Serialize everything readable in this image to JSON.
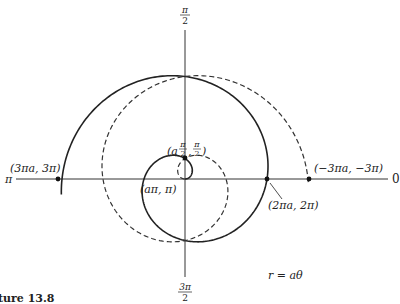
{
  "figure": {
    "caption": "ture 13.8",
    "equation": "r = aθ",
    "colors": {
      "ink": "#222222",
      "background": "#ffffff"
    },
    "axis_labels": {
      "top": {
        "num": "π",
        "den": "2"
      },
      "bottom": {
        "num": "3π",
        "den": "2"
      },
      "left": "π",
      "right": "0"
    },
    "points": [
      {
        "id": "p-3pi",
        "label": "(3πa, 3π)",
        "x": 62,
        "y": 179
      },
      {
        "id": "p-pi",
        "label": "(aπ, π)",
        "x": 144,
        "y": 179
      },
      {
        "id": "p-pi2",
        "label_a": "(a",
        "label_frac1": {
          "num": "π",
          "den": "2"
        },
        "label_sep": ",",
        "label_frac2": {
          "num": "π",
          "den": "2"
        },
        "label_close": ")",
        "x": 185,
        "y": 158
      },
      {
        "id": "p-2pi",
        "label": "(2πa, 2π)",
        "x": 267,
        "y": 179
      },
      {
        "id": "p-neg3pi",
        "label": "(−3πa, −3π)",
        "x": 309,
        "y": 179
      }
    ]
  },
  "chart_data": {
    "type": "line",
    "equation": "r = aθ",
    "coordinate_system": "polar",
    "series": [
      {
        "name": "θ ≥ 0 (solid)",
        "style": "solid",
        "theta_range": [
          0,
          3.05
        ],
        "theta_units": "π"
      },
      {
        "name": "θ ≤ 0 (dashed)",
        "style": "dashed",
        "theta_range": [
          -3.0,
          0
        ],
        "theta_units": "π"
      }
    ],
    "axis_labels": {
      "0": "0",
      "90": "π/2",
      "180": "π",
      "270": "3π/2"
    },
    "annotated_points": [
      {
        "label": "(aπ/2, π/2)",
        "r": "aπ/2",
        "theta": "π/2"
      },
      {
        "label": "(aπ, π)",
        "r": "aπ",
        "theta": "π"
      },
      {
        "label": "(2πa, 2π)",
        "r": "2πa",
        "theta": "2π"
      },
      {
        "label": "(3πa, 3π)",
        "r": "3πa",
        "theta": "3π"
      },
      {
        "label": "(−3πa, −3π)",
        "r": "−3πa",
        "theta": "−3π"
      }
    ],
    "render": {
      "cx": 185,
      "cy": 179,
      "a_px": 13.05,
      "solid_theta_max": 9.55,
      "dashed_theta_min": -9.45
    }
  }
}
